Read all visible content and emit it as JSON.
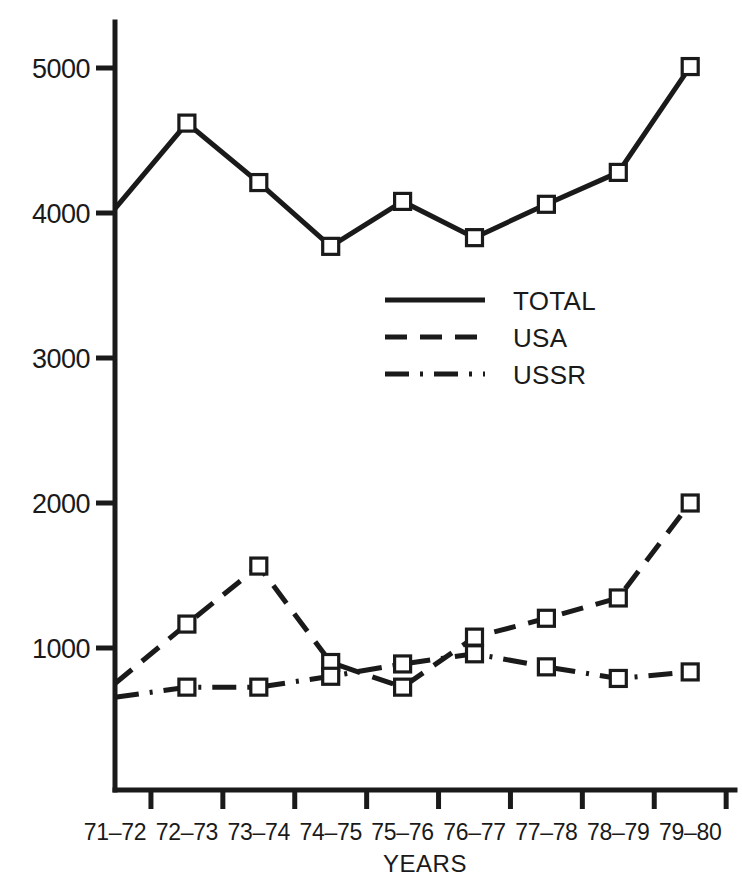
{
  "chart_data": {
    "type": "line",
    "title": "",
    "xlabel": "YEARS",
    "ylabel": "",
    "categories": [
      "71–72",
      "72–73",
      "73–74",
      "74–75",
      "75–76",
      "76–77",
      "77–78",
      "78–79",
      "79–80"
    ],
    "ylim": [
      0,
      5500
    ],
    "yticks": [
      1000,
      2000,
      3000,
      4000,
      5000
    ],
    "ytick_labels": [
      "1000",
      "2000",
      "3000",
      "4000",
      "5000"
    ],
    "grid": false,
    "legend_position": "center",
    "series": [
      {
        "name": "TOTAL",
        "style": "solid",
        "marker": "open-square",
        "values": [
          4030,
          4620,
          4210,
          3770,
          4080,
          3830,
          4060,
          4280,
          5010
        ]
      },
      {
        "name": "USA",
        "style": "dashed",
        "marker": "open-square",
        "values": [
          755,
          1165,
          1565,
          900,
          730,
          1075,
          1205,
          1345,
          2000
        ]
      },
      {
        "name": "USSR",
        "style": "dash-dot",
        "marker": "open-square",
        "values": [
          660,
          730,
          730,
          805,
          890,
          960,
          870,
          790,
          835
        ]
      }
    ]
  },
  "legend": {
    "items": [
      {
        "label": "TOTAL"
      },
      {
        "label": "USA"
      },
      {
        "label": "USSR"
      }
    ]
  },
  "axis": {
    "x_title": "YEARS"
  },
  "colors": {
    "ink": "#1a1a1a",
    "background": "#ffffff",
    "marker_fill": "#ffffff"
  }
}
